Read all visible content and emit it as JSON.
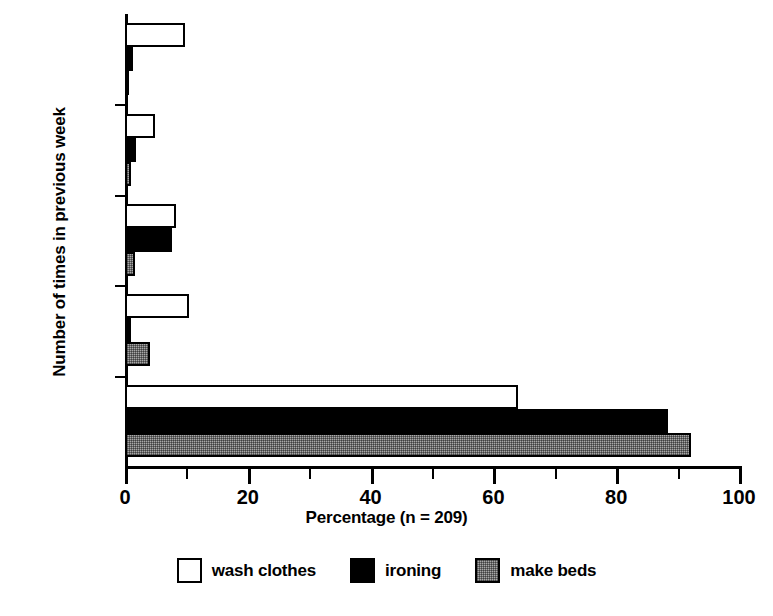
{
  "chart_data": {
    "type": "bar",
    "orientation": "horizontal",
    "title": "",
    "xlabel": "Percentage (n = 209)",
    "ylabel": "Number of times in previous week",
    "categories": [
      "0",
      "1",
      "2",
      "3",
      "4 +"
    ],
    "xlim": [
      0,
      100
    ],
    "xticks": [
      0,
      20,
      40,
      60,
      80,
      100
    ],
    "xtick_labels": [
      "0",
      "20",
      "40",
      "60",
      "80",
      "100"
    ],
    "minor_xticks": [
      10,
      30,
      50,
      70,
      90
    ],
    "grid": false,
    "legend_position": "bottom",
    "series": [
      {
        "name": "wash clothes",
        "fill": "#ffffff",
        "values": [
          64.0,
          10.4,
          8.3,
          4.9,
          9.8
        ]
      },
      {
        "name": "ironing",
        "fill": "#000000",
        "values": [
          88.4,
          1.0,
          7.7,
          1.8,
          1.3
        ]
      },
      {
        "name": "make beds",
        "fill": "#a8a8a8",
        "values": [
          92.2,
          4.0,
          1.7,
          0.9,
          0.3
        ]
      }
    ]
  },
  "legend": {
    "items": [
      {
        "label": "wash clothes",
        "style": "s-wash"
      },
      {
        "label": "ironing",
        "style": "s-iron"
      },
      {
        "label": "make beds",
        "style": "s-beds"
      }
    ]
  }
}
